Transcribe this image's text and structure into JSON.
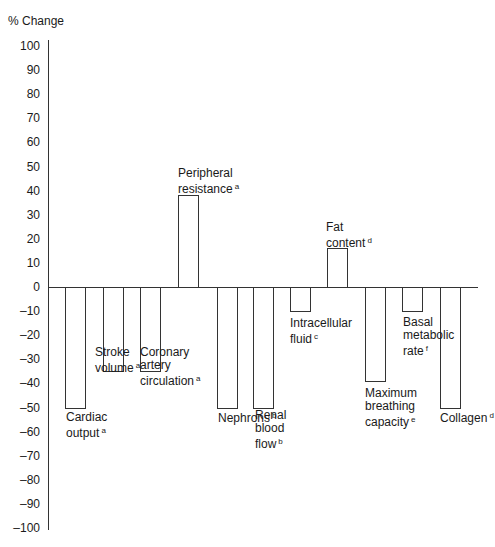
{
  "chart_data": {
    "type": "bar",
    "title": "",
    "xlabel": "",
    "ylabel": "% Change",
    "ylim": [
      -100,
      100
    ],
    "yticks": [
      100,
      90,
      80,
      70,
      60,
      50,
      40,
      30,
      20,
      10,
      0,
      -10,
      -20,
      -30,
      -40,
      -50,
      -60,
      -70,
      -80,
      -90,
      -100
    ],
    "grid": false,
    "legend": null,
    "categories": [
      "Cardiac output",
      "Stroke volume",
      "Coronary artery circulation",
      "Peripheral resistance",
      "Nephrons",
      "Renal blood flow",
      "Intracellular fluid",
      "Fat content",
      "Maximum breathing capacity",
      "Basal metabolic rate",
      "Collagen"
    ],
    "footnotes": [
      "a",
      "a",
      "a",
      "a",
      "b",
      "b",
      "c",
      "d",
      "e",
      "f",
      "d"
    ],
    "values": [
      -50,
      -35,
      -35,
      38,
      -50,
      -50,
      -10,
      16,
      -39,
      -10,
      -50
    ]
  },
  "labels": {
    "ylabel": "% Change",
    "ticks": [
      "100",
      "90",
      "80",
      "70",
      "60",
      "50",
      "40",
      "30",
      "20",
      "10",
      "0",
      "-10",
      "-20",
      "-30",
      "-40",
      "-50",
      "-60",
      "-70",
      "-80",
      "-90",
      "-100"
    ],
    "bars": [
      {
        "lines": [
          "Cardiac",
          "output"
        ],
        "sup": "a"
      },
      {
        "lines": [
          "Stroke",
          "volume"
        ],
        "sup": "a"
      },
      {
        "lines": [
          "Coronary",
          "artery",
          "circulation"
        ],
        "sup": "a"
      },
      {
        "lines": [
          "Peripheral",
          "resistance"
        ],
        "sup": "a"
      },
      {
        "lines": [
          "Nephrons"
        ],
        "sup": "b"
      },
      {
        "lines": [
          "Renal",
          "blood",
          "flow"
        ],
        "sup": "b"
      },
      {
        "lines": [
          "Intracellular",
          "fluid"
        ],
        "sup": "c"
      },
      {
        "lines": [
          "Fat",
          "content"
        ],
        "sup": "d"
      },
      {
        "lines": [
          "Maximum",
          "breathing",
          "capacity"
        ],
        "sup": "e"
      },
      {
        "lines": [
          "Basal",
          "metabolic",
          "rate"
        ],
        "sup": "f"
      },
      {
        "lines": [
          "Collagen"
        ],
        "sup": "d"
      }
    ]
  }
}
